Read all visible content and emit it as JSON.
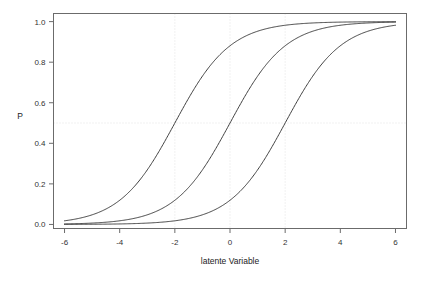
{
  "chart_data": {
    "type": "line",
    "title": "",
    "xlabel": "latente Variable",
    "ylabel": "P",
    "xlim": [
      -6.4,
      6.4
    ],
    "ylim": [
      -0.02,
      1.04
    ],
    "xticks": [
      -6,
      -4,
      -2,
      0,
      2,
      4,
      6
    ],
    "xtick_labels": [
      "-6",
      "-4",
      "-2",
      "0",
      "2",
      "4",
      "6"
    ],
    "yticks": [
      0.0,
      0.2,
      0.4,
      0.6,
      0.8,
      1.0
    ],
    "ytick_labels": [
      "0.0",
      "0.2",
      "0.4",
      "0.6",
      "0.8",
      "1.0"
    ],
    "grid": true,
    "grid_style": "dotted",
    "grid_vlines": [
      -2,
      0,
      2
    ],
    "grid_hlines": [
      0.5
    ],
    "legend": null,
    "legend_position": "none",
    "line_color": "#3f3f3f",
    "frame_color": "#6b6b6b",
    "background": "#ffffff",
    "series": [
      {
        "name": "curve-threshold-minus-2",
        "model": "logistic",
        "threshold": -2,
        "slope": 1,
        "x": [
          -6,
          -5.5,
          -5,
          -4.5,
          -4,
          -3.5,
          -3,
          -2.5,
          -2,
          -1.5,
          -1,
          -0.5,
          0,
          0.5,
          1,
          1.5,
          2,
          2.5,
          3,
          3.5,
          4,
          4.5,
          5,
          5.5,
          6
        ],
        "y": [
          0.018,
          0.029,
          0.047,
          0.076,
          0.119,
          0.182,
          0.269,
          0.378,
          0.5,
          0.622,
          0.731,
          0.818,
          0.881,
          0.924,
          0.953,
          0.971,
          0.982,
          0.989,
          0.993,
          0.996,
          0.998,
          0.999,
          0.999,
          1.0,
          1.0
        ]
      },
      {
        "name": "curve-threshold-0",
        "model": "logistic",
        "threshold": 0,
        "slope": 1,
        "x": [
          -6,
          -5.5,
          -5,
          -4.5,
          -4,
          -3.5,
          -3,
          -2.5,
          -2,
          -1.5,
          -1,
          -0.5,
          0,
          0.5,
          1,
          1.5,
          2,
          2.5,
          3,
          3.5,
          4,
          4.5,
          5,
          5.5,
          6
        ],
        "y": [
          0.002,
          0.004,
          0.007,
          0.011,
          0.018,
          0.029,
          0.047,
          0.076,
          0.119,
          0.182,
          0.269,
          0.378,
          0.5,
          0.622,
          0.731,
          0.818,
          0.881,
          0.924,
          0.953,
          0.971,
          0.982,
          0.989,
          0.993,
          0.996,
          0.998
        ]
      },
      {
        "name": "curve-threshold-2",
        "model": "logistic",
        "threshold": 2,
        "slope": 1,
        "x": [
          -6,
          -5.5,
          -5,
          -4.5,
          -4,
          -3.5,
          -3,
          -2.5,
          -2,
          -1.5,
          -1,
          -0.5,
          0,
          0.5,
          1,
          1.5,
          2,
          2.5,
          3,
          3.5,
          4,
          4.5,
          5,
          5.5,
          6
        ],
        "y": [
          0.0003,
          0.0005,
          0.0009,
          0.0015,
          0.002,
          0.004,
          0.007,
          0.011,
          0.018,
          0.029,
          0.047,
          0.076,
          0.119,
          0.182,
          0.269,
          0.378,
          0.5,
          0.622,
          0.731,
          0.818,
          0.881,
          0.924,
          0.953,
          0.971,
          0.982
        ]
      }
    ]
  }
}
